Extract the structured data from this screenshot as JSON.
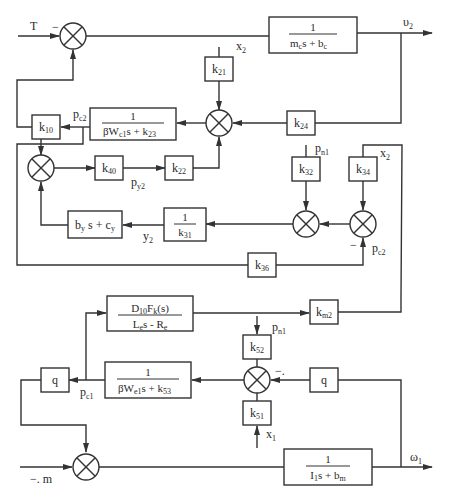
{
  "diagram": {
    "type": "block-diagram",
    "inputs": {
      "T": "T",
      "m": "−. m",
      "x2_top": "x",
      "x2_top_sub": "2",
      "x2_right": "x",
      "x2_right_sub": "2",
      "pn1_mid": "p",
      "pn1_mid_sub": "n1",
      "pn1_low": "p",
      "pn1_low_sub": "n1",
      "x1": "x",
      "x1_sub": "1"
    },
    "outputs": {
      "v2": "υ",
      "v2_sub": "2",
      "w1": "ω",
      "w1_sub": "1"
    },
    "signals": {
      "pc2_left": "p",
      "pc2_left_sub": "c2",
      "pc2_right": "p",
      "pc2_right_sub": "c2",
      "py2": "p",
      "py2_sub": "y2",
      "y2": "y",
      "y2_sub": "2",
      "pc1": "p",
      "pc1_sub": "c1"
    },
    "signs": {
      "minus_T": "−",
      "minus_pc2": "−",
      "minus_q": "−."
    },
    "blocks": {
      "mc": {
        "num": "1",
        "den": "mcs + bc",
        "den_a": "m",
        "den_a_sub": "c",
        "den_b": "s + b",
        "den_b_sub": "c"
      },
      "bw_c1_k23": {
        "num": "1",
        "den_a": "βW",
        "den_a_sub": "c1",
        "den_b": "s + k",
        "den_b_sub": "23"
      },
      "k21": {
        "k": "k",
        "sub": "21"
      },
      "k24": {
        "k": "k",
        "sub": "24"
      },
      "k10": {
        "k": "k",
        "sub": "10"
      },
      "k40": {
        "k": "k",
        "sub": "40"
      },
      "k22": {
        "k": "k",
        "sub": "22"
      },
      "k32": {
        "k": "k",
        "sub": "32"
      },
      "k34": {
        "k": "k",
        "sub": "34"
      },
      "k31": {
        "num": "1",
        "den_a": "k",
        "den_a_sub": "31"
      },
      "bycy": {
        "a": "b",
        "a_sub": "y",
        "b": " s + c",
        "b_sub": "y"
      },
      "k36": {
        "k": "k",
        "sub": "36"
      },
      "dfk": {
        "num_a": "D",
        "num_a_sub": "10",
        "num_b": "F",
        "num_b_sub": "k",
        "num_c": "(s)",
        "den_a": "L",
        "den_a_sub": "e",
        "den_b": "s  - R",
        "den_b_sub": "e"
      },
      "km2": {
        "k": "k",
        "sub": "m2"
      },
      "k52": {
        "k": "k",
        "sub": "52"
      },
      "k51": {
        "k": "k",
        "sub": "51"
      },
      "q_left": {
        "k": "q"
      },
      "q_right": {
        "k": "q"
      },
      "bw_e1_k53": {
        "num": "1",
        "den_a": "βW",
        "den_a_sub": "e1",
        "den_b": "s + k",
        "den_b_sub": "53"
      },
      "i1bm": {
        "num": "1",
        "den_a": "I",
        "den_a_sub": "1",
        "den_b": "s + b",
        "den_b_sub": "m"
      }
    },
    "summing_junctions": [
      "sum-T",
      "sum-center",
      "sum-left-mid",
      "sum-k32",
      "sum-k34",
      "sum-lower",
      "sum-m"
    ]
  }
}
